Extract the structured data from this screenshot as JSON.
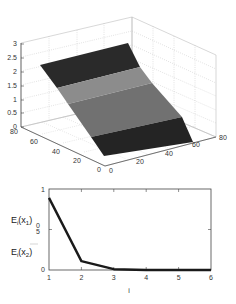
{
  "chart_data": [
    {
      "type": "surface3d",
      "title": "",
      "zlabel": "",
      "xlabel": "",
      "ylabel": "",
      "zlim": [
        0,
        3
      ],
      "xlim": [
        0,
        80
      ],
      "ylim": [
        0,
        80
      ],
      "z_ticks": [
        "0",
        "0.5",
        "1",
        "1.5",
        "2",
        "2.5",
        "3"
      ],
      "x_ticks": [
        "0",
        "20",
        "40",
        "60",
        "80"
      ],
      "y_ticks": [
        "80",
        "60",
        "40",
        "20",
        "0"
      ],
      "grid": true,
      "surface": {
        "description": "inclined plane rising from z=0 at front to z≈2.3 at back",
        "z_front": 0,
        "z_back": 2.3,
        "bands": [
          {
            "name": "band-1",
            "shade": "#2a2a2a"
          },
          {
            "name": "band-2",
            "shade": "#8a8a8a"
          },
          {
            "name": "band-3",
            "shade": "#6e6e6e"
          },
          {
            "name": "band-4",
            "shade": "#222222"
          }
        ]
      }
    },
    {
      "type": "line",
      "title": "",
      "xlabel": "i",
      "ylabel_top": "E_i(x_1)",
      "ylabel_bottom": "E_i(x_2)",
      "x": [
        1,
        2,
        3,
        4,
        5,
        6
      ],
      "series": [
        {
          "name": "ratio",
          "values": [
            0.89,
            0.11,
            0.01,
            0.0,
            0.0,
            0.0
          ],
          "color": "#1a1a1a"
        }
      ],
      "xlim": [
        1,
        6
      ],
      "ylim": [
        0,
        1
      ],
      "x_ticks": [
        "1",
        "2",
        "3",
        "4",
        "5",
        "6"
      ],
      "y_ticks": [
        "0",
        "0.5",
        "1"
      ],
      "grid": false
    }
  ],
  "labels": {
    "z_ticks": [
      "3",
      "2.5",
      "2",
      "1.5",
      "1",
      "0.5",
      "0"
    ],
    "left_axis_ticks": [
      "80",
      "60",
      "40",
      "20",
      "0"
    ],
    "right_axis_ticks": [
      "0",
      "20",
      "40",
      "60",
      "80"
    ],
    "line_x_ticks": [
      "1",
      "2",
      "3",
      "4",
      "5",
      "6"
    ],
    "line_y_tick_top": "1",
    "line_y_tick_mid_a": "0",
    "line_y_tick_mid_b": "5",
    "line_y_tick_bottom": "0",
    "line_xlabel": "i",
    "ylabel_num_main": "E",
    "ylabel_num_sub": "i",
    "ylabel_num_arg": "(x",
    "ylabel_num_arg_sub": "1",
    "ylabel_num_close": ")",
    "ylabel_den_main": "E",
    "ylabel_den_sub": "i",
    "ylabel_den_arg": "(x",
    "ylabel_den_arg_sub": "2",
    "ylabel_den_close": ")"
  }
}
